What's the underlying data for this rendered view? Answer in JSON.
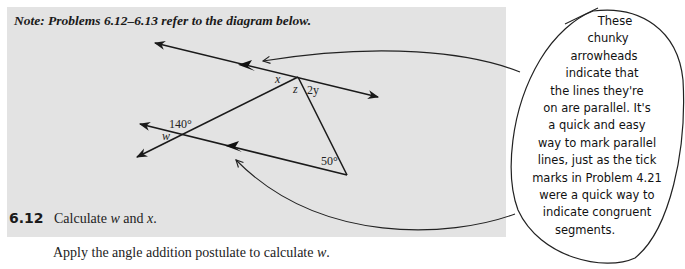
{
  "note": "Note: Problems 6.12–6.13 refer to the diagram below.",
  "diagram": {
    "labels": {
      "x": "x",
      "z": "z",
      "two_y": "2y",
      "angle_140": "140°",
      "w": "w",
      "angle_50": "50°"
    },
    "icons": [
      "parallel-arrowhead-icon",
      "line-arrowhead-icon"
    ]
  },
  "problem": {
    "number": "6.12",
    "text_prefix": "Calculate ",
    "var1": "w",
    "text_mid": " and ",
    "var2": "x",
    "text_suffix": "."
  },
  "instruction": {
    "prefix": "Apply the angle addition postulate to calculate ",
    "var": "w",
    "suffix": "."
  },
  "annotation": {
    "lines": [
      "These",
      "chunky",
      "arrowheads",
      "indicate that",
      "the lines they're",
      "on are parallel. It's",
      "a quick and easy",
      "way to mark parallel",
      "lines, just as the tick",
      "marks in Problem 4.21",
      "were a quick way to",
      "indicate congruent",
      "segments."
    ]
  }
}
